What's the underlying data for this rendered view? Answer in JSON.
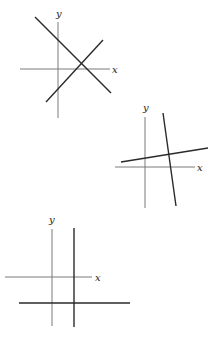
{
  "diagrams": [
    {
      "id": "graph-1",
      "axis_labels": {
        "x": "x",
        "y": "y"
      },
      "description": "Two intersecting oblique lines, one descending and one ascending, crossing on the x-axis to the right of the origin"
    },
    {
      "id": "graph-2",
      "axis_labels": {
        "x": "x",
        "y": "y"
      },
      "description": "A steep line with negative slope and a shallow line with positive slope intersecting above the x-axis, right of the y-axis"
    },
    {
      "id": "graph-3",
      "axis_labels": {
        "x": "x",
        "y": "y"
      },
      "description": "A vertical line right of the y-axis and a horizontal line below the x-axis, intersecting in the fourth quadrant"
    }
  ],
  "colors": {
    "axis": "#7a7a7a",
    "line": "#2a2a2a",
    "background": "#ffffff"
  }
}
